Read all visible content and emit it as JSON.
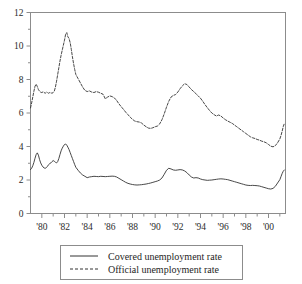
{
  "chart_data": {
    "type": "line",
    "title": "",
    "subtitle": "",
    "xlabel": "",
    "ylabel": "",
    "xlim": [
      1979.0,
      2001.5
    ],
    "ylim": [
      0,
      12
    ],
    "grid": false,
    "legend_position": "bottom-center",
    "y_ticks": [
      "0",
      "2",
      "4",
      "6",
      "8",
      "10",
      "12"
    ],
    "y_tick_values": [
      0,
      2,
      4,
      6,
      8,
      10,
      12
    ],
    "y_minor_tick_values": [
      1,
      3,
      5,
      7,
      9,
      11
    ],
    "x_ticks": [
      "'80",
      "'82",
      "'84",
      "'86",
      "'88",
      "'90",
      "'92",
      "'94",
      "'96",
      "'98",
      "'00"
    ],
    "x_tick_values": [
      1980,
      1982,
      1984,
      1986,
      1988,
      1990,
      1992,
      1994,
      1996,
      1998,
      2000
    ],
    "x_minor_tick_values": [
      1981,
      1983,
      1985,
      1987,
      1989,
      1991,
      1993,
      1995,
      1997,
      1999,
      2001
    ],
    "axis_color": "#8c8c8c",
    "series": [
      {
        "name": "Covered unemployment rate",
        "style": "solid",
        "color": "#333333",
        "x": [
          1979.0,
          1979.1,
          1979.2,
          1979.3,
          1979.4,
          1979.5,
          1979.6,
          1979.7,
          1979.8,
          1979.9,
          1980.0,
          1980.1,
          1980.2,
          1980.3,
          1980.4,
          1980.5,
          1980.6,
          1980.7,
          1980.8,
          1980.9,
          1981.0,
          1981.1,
          1981.2,
          1981.3,
          1981.4,
          1981.5,
          1981.6,
          1981.7,
          1981.8,
          1981.9,
          1982.0,
          1982.1,
          1982.2,
          1982.3,
          1982.4,
          1982.5,
          1982.6,
          1982.7,
          1982.8,
          1982.9,
          1983.0,
          1983.2,
          1983.4,
          1983.6,
          1983.8,
          1984.0,
          1984.2,
          1984.4,
          1984.6,
          1984.8,
          1985.0,
          1985.2,
          1985.4,
          1985.6,
          1985.8,
          1986.0,
          1986.2,
          1986.4,
          1986.6,
          1986.8,
          1987.0,
          1987.2,
          1987.4,
          1987.6,
          1987.8,
          1988.0,
          1988.2,
          1988.4,
          1988.6,
          1988.8,
          1989.0,
          1989.2,
          1989.4,
          1989.6,
          1989.8,
          1990.0,
          1990.2,
          1990.4,
          1990.6,
          1990.8,
          1991.0,
          1991.2,
          1991.4,
          1991.6,
          1991.8,
          1992.0,
          1992.2,
          1992.4,
          1992.6,
          1992.8,
          1993.0,
          1993.2,
          1993.4,
          1993.6,
          1993.8,
          1994.0,
          1994.2,
          1994.4,
          1994.6,
          1994.8,
          1995.0,
          1995.2,
          1995.4,
          1995.6,
          1995.8,
          1996.0,
          1996.2,
          1996.4,
          1996.6,
          1996.8,
          1997.0,
          1997.2,
          1997.4,
          1997.6,
          1997.8,
          1998.0,
          1998.2,
          1998.4,
          1998.6,
          1998.8,
          1999.0,
          1999.2,
          1999.4,
          1999.6,
          1999.8,
          2000.0,
          2000.2,
          2000.4,
          2000.6,
          2000.8,
          2001.0,
          2001.1,
          2001.2,
          2001.3,
          2001.4
        ],
        "y": [
          2.62,
          2.7,
          2.85,
          3.05,
          3.3,
          3.52,
          3.62,
          3.48,
          3.22,
          3.02,
          2.88,
          2.78,
          2.72,
          2.7,
          2.74,
          2.82,
          2.92,
          2.98,
          3.02,
          3.1,
          3.16,
          3.12,
          3.06,
          3.02,
          3.1,
          3.28,
          3.52,
          3.74,
          3.9,
          4.02,
          4.12,
          4.15,
          4.08,
          3.96,
          3.82,
          3.64,
          3.46,
          3.28,
          3.1,
          2.92,
          2.76,
          2.58,
          2.42,
          2.3,
          2.22,
          2.14,
          2.18,
          2.2,
          2.22,
          2.21,
          2.2,
          2.22,
          2.21,
          2.2,
          2.21,
          2.22,
          2.23,
          2.22,
          2.18,
          2.1,
          2.02,
          1.94,
          1.86,
          1.8,
          1.76,
          1.73,
          1.71,
          1.7,
          1.71,
          1.72,
          1.74,
          1.76,
          1.79,
          1.82,
          1.86,
          1.9,
          1.94,
          2.0,
          2.12,
          2.34,
          2.58,
          2.7,
          2.66,
          2.6,
          2.58,
          2.6,
          2.62,
          2.6,
          2.54,
          2.44,
          2.3,
          2.18,
          2.12,
          2.14,
          2.12,
          2.06,
          2.02,
          2.0,
          1.98,
          1.99,
          2.0,
          2.02,
          2.04,
          2.06,
          2.07,
          2.06,
          2.04,
          2.02,
          1.98,
          1.94,
          1.9,
          1.86,
          1.82,
          1.78,
          1.74,
          1.7,
          1.68,
          1.67,
          1.68,
          1.67,
          1.66,
          1.64,
          1.6,
          1.56,
          1.52,
          1.48,
          1.46,
          1.5,
          1.62,
          1.82,
          2.02,
          2.2,
          2.38,
          2.52,
          2.6
        ]
      },
      {
        "name": "Official unemployment rate",
        "style": "dashed",
        "color": "#333333",
        "x": [
          1979.0,
          1979.1,
          1979.2,
          1979.3,
          1979.4,
          1979.5,
          1979.6,
          1979.7,
          1979.8,
          1979.9,
          1980.0,
          1980.1,
          1980.2,
          1980.3,
          1980.4,
          1980.5,
          1980.6,
          1980.7,
          1980.8,
          1980.9,
          1981.0,
          1981.1,
          1981.2,
          1981.3,
          1981.4,
          1981.5,
          1981.6,
          1981.7,
          1981.8,
          1981.9,
          1982.0,
          1982.1,
          1982.2,
          1982.3,
          1982.4,
          1982.5,
          1982.6,
          1982.7,
          1982.8,
          1982.9,
          1983.0,
          1983.2,
          1983.4,
          1983.6,
          1983.8,
          1984.0,
          1984.2,
          1984.4,
          1984.6,
          1984.8,
          1985.0,
          1985.2,
          1985.4,
          1985.6,
          1985.8,
          1986.0,
          1986.2,
          1986.4,
          1986.6,
          1986.8,
          1987.0,
          1987.2,
          1987.4,
          1987.6,
          1987.8,
          1988.0,
          1988.2,
          1988.4,
          1988.6,
          1988.8,
          1989.0,
          1989.2,
          1989.4,
          1989.6,
          1989.8,
          1990.0,
          1990.2,
          1990.4,
          1990.6,
          1990.8,
          1991.0,
          1991.2,
          1991.4,
          1991.6,
          1991.8,
          1992.0,
          1992.2,
          1992.4,
          1992.6,
          1992.8,
          1993.0,
          1993.2,
          1993.4,
          1993.6,
          1993.8,
          1994.0,
          1994.2,
          1994.4,
          1994.6,
          1994.8,
          1995.0,
          1995.2,
          1995.4,
          1995.6,
          1995.8,
          1996.0,
          1996.2,
          1996.4,
          1996.6,
          1996.8,
          1997.0,
          1997.2,
          1997.4,
          1997.6,
          1997.8,
          1998.0,
          1998.2,
          1998.4,
          1998.6,
          1998.8,
          1999.0,
          1999.2,
          1999.4,
          1999.6,
          1999.8,
          2000.0,
          2000.2,
          2000.4,
          2000.6,
          2000.8,
          2001.0,
          2001.1,
          2001.2,
          2001.3,
          2001.4
        ],
        "y": [
          6.3,
          6.6,
          6.95,
          7.3,
          7.6,
          7.72,
          7.58,
          7.4,
          7.3,
          7.24,
          7.22,
          7.26,
          7.22,
          7.18,
          7.24,
          7.22,
          7.18,
          7.22,
          7.2,
          7.18,
          7.22,
          7.3,
          7.55,
          7.9,
          8.3,
          8.7,
          9.1,
          9.45,
          9.75,
          10.05,
          10.35,
          10.7,
          10.8,
          10.55,
          10.45,
          10.2,
          9.8,
          9.35,
          8.95,
          8.6,
          8.3,
          8.05,
          7.8,
          7.55,
          7.35,
          7.28,
          7.32,
          7.25,
          7.22,
          7.28,
          7.24,
          7.18,
          7.12,
          6.85,
          6.95,
          7.02,
          6.98,
          6.9,
          6.75,
          6.55,
          6.38,
          6.22,
          6.05,
          5.9,
          5.75,
          5.62,
          5.52,
          5.48,
          5.46,
          5.4,
          5.28,
          5.18,
          5.1,
          5.08,
          5.12,
          5.18,
          5.22,
          5.35,
          5.6,
          5.95,
          6.35,
          6.7,
          6.95,
          7.05,
          7.1,
          7.25,
          7.45,
          7.62,
          7.75,
          7.7,
          7.55,
          7.4,
          7.28,
          7.15,
          7.02,
          6.88,
          6.7,
          6.5,
          6.32,
          6.15,
          6.0,
          5.9,
          5.82,
          5.88,
          5.82,
          5.7,
          5.6,
          5.52,
          5.45,
          5.38,
          5.28,
          5.18,
          5.08,
          4.98,
          4.88,
          4.78,
          4.68,
          4.58,
          4.52,
          4.48,
          4.42,
          4.38,
          4.32,
          4.28,
          4.22,
          4.12,
          4.02,
          3.98,
          4.05,
          4.22,
          4.45,
          4.65,
          4.9,
          5.18,
          5.38
        ]
      }
    ]
  },
  "legend": {
    "entries": [
      {
        "label": "Covered unemployment rate",
        "style": "solid"
      },
      {
        "label": "Official unemployment rate",
        "style": "dashed"
      }
    ]
  }
}
